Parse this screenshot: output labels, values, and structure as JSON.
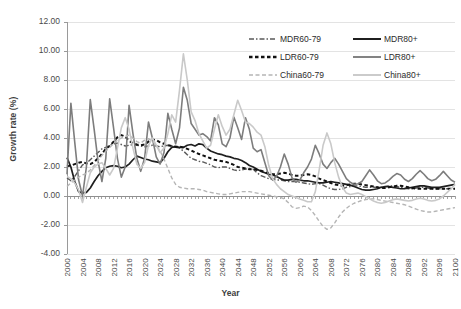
{
  "chart_data": {
    "type": "line",
    "title": "",
    "xlabel": "Year",
    "ylabel": "Growth rate (%)",
    "xlim": [
      2000,
      2100
    ],
    "ylim": [
      -4.0,
      12.0
    ],
    "ytick_step": 2.0,
    "xtick_step": 4,
    "grid": true,
    "legend_position": "top-right",
    "ytick_labels": [
      "12.00",
      "10.00",
      "8.00",
      "6.00",
      "4.00",
      "2.00",
      "0.00",
      "-2.00",
      "-4.00"
    ],
    "ytick_values": [
      12,
      10,
      8,
      6,
      4,
      2,
      0,
      -2,
      -4
    ],
    "xtick_labels": [
      "2000",
      "2004",
      "2008",
      "2012",
      "2016",
      "2020",
      "2024",
      "2028",
      "2032",
      "2036",
      "2040",
      "2044",
      "2048",
      "2052",
      "2056",
      "2060",
      "2064",
      "2068",
      "2072",
      "2076",
      "2080",
      "2084",
      "2088",
      "2092",
      "2096",
      "2100"
    ],
    "x": [
      2000,
      2001,
      2002,
      2003,
      2004,
      2005,
      2006,
      2007,
      2008,
      2009,
      2010,
      2011,
      2012,
      2013,
      2014,
      2015,
      2016,
      2017,
      2018,
      2019,
      2020,
      2021,
      2022,
      2023,
      2024,
      2025,
      2026,
      2027,
      2028,
      2029,
      2030,
      2031,
      2032,
      2033,
      2034,
      2035,
      2036,
      2037,
      2038,
      2039,
      2040,
      2041,
      2042,
      2043,
      2044,
      2045,
      2046,
      2047,
      2048,
      2049,
      2050,
      2051,
      2052,
      2053,
      2054,
      2055,
      2056,
      2057,
      2058,
      2059,
      2060,
      2061,
      2062,
      2063,
      2064,
      2065,
      2066,
      2067,
      2068,
      2069,
      2070,
      2071,
      2072,
      2073,
      2074,
      2075,
      2076,
      2077,
      2078,
      2079,
      2080,
      2081,
      2082,
      2083,
      2084,
      2085,
      2086,
      2087,
      2088,
      2089,
      2090,
      2091,
      2092,
      2093,
      2094,
      2095,
      2096,
      2097,
      2098,
      2099,
      2100
    ],
    "series": [
      {
        "name": "MDR60-79",
        "color": "#5a5a5a",
        "width": 1.4,
        "dash": "5,2,1.5,2",
        "values": [
          1.25,
          1.05,
          1.35,
          1.75,
          2.15,
          2.25,
          2.5,
          2.75,
          3.0,
          3.25,
          3.35,
          3.5,
          3.6,
          3.65,
          3.55,
          3.45,
          3.5,
          3.55,
          3.5,
          3.45,
          3.4,
          3.45,
          3.5,
          3.45,
          3.4,
          3.45,
          3.5,
          3.45,
          3.35,
          3.3,
          3.1,
          2.85,
          2.6,
          2.5,
          2.4,
          2.35,
          2.25,
          2.15,
          2.0,
          1.95,
          2.0,
          2.0,
          1.9,
          1.8,
          1.75,
          1.8,
          1.85,
          1.9,
          1.85,
          1.6,
          1.4,
          1.3,
          1.2,
          1.15,
          1.1,
          1.1,
          1.05,
          1.0,
          1.0,
          1.0,
          0.95,
          0.9,
          0.85,
          0.8,
          0.85,
          0.85,
          0.75,
          0.6,
          0.5,
          0.45,
          0.45,
          0.5,
          0.6,
          0.65,
          0.7,
          0.7,
          0.65,
          0.6,
          0.6,
          0.6,
          0.6,
          0.6,
          0.65,
          0.7,
          0.7,
          0.65,
          0.6,
          0.55,
          0.5,
          0.5,
          0.55,
          0.6,
          0.6,
          0.55,
          0.5,
          0.5,
          0.5,
          0.5,
          0.5,
          0.5,
          0.5
        ]
      },
      {
        "name": "MDR80+",
        "color": "#1f1f1f",
        "width": 1.7,
        "dash": "none",
        "values": [
          2.65,
          2.0,
          1.0,
          0.3,
          0.2,
          0.25,
          0.55,
          1.0,
          1.4,
          1.7,
          1.95,
          2.05,
          2.1,
          2.05,
          1.95,
          2.0,
          2.2,
          2.5,
          2.75,
          2.65,
          2.55,
          2.5,
          2.4,
          2.35,
          2.3,
          2.6,
          3.05,
          3.35,
          3.4,
          3.35,
          3.35,
          3.5,
          3.55,
          3.45,
          3.6,
          3.55,
          3.3,
          3.1,
          3.0,
          2.9,
          2.85,
          2.75,
          2.7,
          2.6,
          2.55,
          2.45,
          2.3,
          2.1,
          2.0,
          1.85,
          1.7,
          1.6,
          1.5,
          1.45,
          1.35,
          1.2,
          1.1,
          1.1,
          1.15,
          1.15,
          1.1,
          1.05,
          1.05,
          1.0,
          0.95,
          0.9,
          0.9,
          0.95,
          1.0,
          0.95,
          0.9,
          0.85,
          0.8,
          0.75,
          0.65,
          0.55,
          0.45,
          0.4,
          0.4,
          0.45,
          0.5,
          0.6,
          0.65,
          0.65,
          0.6,
          0.55,
          0.5,
          0.5,
          0.55,
          0.6,
          0.65,
          0.7,
          0.7,
          0.65,
          0.6,
          0.6,
          0.6,
          0.65,
          0.7,
          0.75,
          0.8
        ]
      },
      {
        "name": "LDR60-79",
        "color": "#111111",
        "width": 2.0,
        "dash": "3.5,2.5",
        "values": [
          2.05,
          2.1,
          2.2,
          2.3,
          2.35,
          2.25,
          2.2,
          2.35,
          2.6,
          2.9,
          3.25,
          3.45,
          3.75,
          4.05,
          4.2,
          4.1,
          3.8,
          3.65,
          3.55,
          3.5,
          3.55,
          3.75,
          3.9,
          3.85,
          3.7,
          3.6,
          3.5,
          3.45,
          3.4,
          3.4,
          3.35,
          3.25,
          3.15,
          3.0,
          2.9,
          2.8,
          2.7,
          2.6,
          2.5,
          2.45,
          2.4,
          2.35,
          2.25,
          2.15,
          2.0,
          1.95,
          1.9,
          1.85,
          1.85,
          1.8,
          1.75,
          1.65,
          1.55,
          1.5,
          1.5,
          1.55,
          1.6,
          1.55,
          1.45,
          1.4,
          1.4,
          1.45,
          1.5,
          1.45,
          1.35,
          1.2,
          1.1,
          1.0,
          0.9,
          0.8,
          0.75,
          0.7,
          0.75,
          0.8,
          0.85,
          0.85,
          0.8,
          0.75,
          0.7,
          0.65,
          0.6,
          0.55,
          0.55,
          0.6,
          0.65,
          0.7,
          0.7,
          0.65,
          0.6,
          0.55,
          0.5,
          0.5,
          0.5,
          0.5,
          0.5,
          0.5,
          0.5,
          0.5,
          0.5,
          0.5,
          0.5
        ]
      },
      {
        "name": "LDR80+",
        "color": "#7d7d7d",
        "width": 1.6,
        "dash": "none",
        "values": [
          1.5,
          6.4,
          3.7,
          1.1,
          0.0,
          2.0,
          6.65,
          4.6,
          2.4,
          1.0,
          2.6,
          6.7,
          4.7,
          2.6,
          1.3,
          2.0,
          6.25,
          4.3,
          2.6,
          1.7,
          2.6,
          5.1,
          4.0,
          2.7,
          2.2,
          3.0,
          5.7,
          4.6,
          3.6,
          4.7,
          7.5,
          6.6,
          5.0,
          4.6,
          4.2,
          4.3,
          4.1,
          3.8,
          5.4,
          4.9,
          3.6,
          3.4,
          4.0,
          5.45,
          4.7,
          3.9,
          5.4,
          4.6,
          3.3,
          3.05,
          3.2,
          2.3,
          1.4,
          1.1,
          1.35,
          2.0,
          2.9,
          2.2,
          1.25,
          0.95,
          1.1,
          1.6,
          2.0,
          2.55,
          3.5,
          2.9,
          2.2,
          1.9,
          2.3,
          2.6,
          2.2,
          1.7,
          1.2,
          0.95,
          0.8,
          0.85,
          1.0,
          1.4,
          1.8,
          1.45,
          1.05,
          0.85,
          0.9,
          1.1,
          1.35,
          1.55,
          1.45,
          1.15,
          1.0,
          1.2,
          1.5,
          1.75,
          1.5,
          1.2,
          1.05,
          1.15,
          1.4,
          1.7,
          1.4,
          1.1,
          0.95
        ]
      },
      {
        "name": "China60-79",
        "color": "#b5b5b5",
        "width": 1.4,
        "dash": "4,2.5",
        "values": [
          0.65,
          0.9,
          1.1,
          1.3,
          1.45,
          1.55,
          1.8,
          2.1,
          2.45,
          2.8,
          3.1,
          3.35,
          3.6,
          3.85,
          4.0,
          4.1,
          4.2,
          4.0,
          3.75,
          3.65,
          3.85,
          3.95,
          3.8,
          3.5,
          3.1,
          2.55,
          1.9,
          1.25,
          0.8,
          0.6,
          0.55,
          0.5,
          0.5,
          0.5,
          0.45,
          0.4,
          0.3,
          0.25,
          0.2,
          0.15,
          0.1,
          0.1,
          0.15,
          0.2,
          0.25,
          0.3,
          0.3,
          0.3,
          0.25,
          0.2,
          0.15,
          0.1,
          0.05,
          0.0,
          -0.05,
          -0.1,
          -0.2,
          -0.45,
          -0.75,
          -0.85,
          -0.8,
          -0.7,
          -0.75,
          -1.0,
          -1.35,
          -1.75,
          -2.1,
          -2.3,
          -2.2,
          -1.85,
          -1.45,
          -1.1,
          -0.85,
          -0.65,
          -0.5,
          -0.4,
          -0.3,
          -0.25,
          -0.2,
          -0.2,
          -0.25,
          -0.3,
          -0.35,
          -0.4,
          -0.45,
          -0.5,
          -0.55,
          -0.6,
          -0.7,
          -0.8,
          -0.9,
          -1.0,
          -1.05,
          -1.1,
          -1.1,
          -1.05,
          -1.0,
          -0.95,
          -0.9,
          -0.85,
          -0.8
        ]
      },
      {
        "name": "China80+",
        "color": "#c9c9c9",
        "width": 1.6,
        "dash": "none",
        "values": [
          1.35,
          1.2,
          0.9,
          0.4,
          -0.45,
          0.6,
          1.6,
          2.0,
          2.2,
          2.3,
          1.9,
          1.45,
          1.9,
          3.3,
          4.7,
          5.4,
          4.6,
          3.3,
          2.2,
          1.9,
          2.3,
          3.5,
          4.0,
          3.5,
          3.0,
          3.3,
          4.3,
          5.6,
          5.1,
          7.3,
          9.8,
          8.0,
          5.8,
          5.2,
          4.3,
          3.8,
          3.3,
          3.5,
          4.6,
          5.6,
          4.8,
          4.2,
          4.6,
          5.6,
          6.6,
          5.9,
          5.1,
          5.0,
          4.75,
          4.4,
          4.2,
          3.4,
          2.1,
          1.2,
          0.8,
          0.5,
          0.3,
          0.1,
          0.0,
          -0.1,
          -0.2,
          -0.3,
          -0.4,
          -0.4,
          0.3,
          1.8,
          3.5,
          4.35,
          3.6,
          2.3,
          1.3,
          0.6,
          0.2,
          0.1,
          0.15,
          0.2,
          0.1,
          -0.05,
          -0.2,
          -0.35,
          -0.45,
          -0.5,
          -0.45,
          -0.35,
          -0.25,
          -0.2,
          -0.25,
          -0.3,
          -0.35,
          -0.3,
          -0.2,
          -0.15,
          -0.2,
          -0.3,
          -0.35,
          -0.3,
          -0.2,
          0.0,
          0.25,
          0.5,
          0.8
        ]
      }
    ]
  },
  "legend": {
    "items": [
      {
        "label": "MDR60-79"
      },
      {
        "label": "MDR80+"
      },
      {
        "label": "LDR60-79"
      },
      {
        "label": "LDR80+"
      },
      {
        "label": "China60-79"
      },
      {
        "label": "China80+"
      }
    ]
  }
}
